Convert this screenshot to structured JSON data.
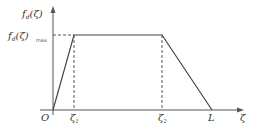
{
  "diagram": {
    "y_axis_label": "fₐ(ζ)",
    "y_axis_label_base": "f",
    "y_axis_label_sub": "d",
    "y_axis_label_arg": "(ζ)",
    "max_label_base": "f",
    "max_label_sub": "d",
    "max_label_arg": "(ζ)",
    "max_label_suffix": "max",
    "origin_label": "O",
    "zeta1_base": "ζ",
    "zeta1_sub": "1",
    "zeta2_base": "ζ",
    "zeta2_sub": "2",
    "L_label": "L",
    "x_axis_label": "ζ",
    "line_color": "#555555",
    "dash_color": "#555555"
  }
}
